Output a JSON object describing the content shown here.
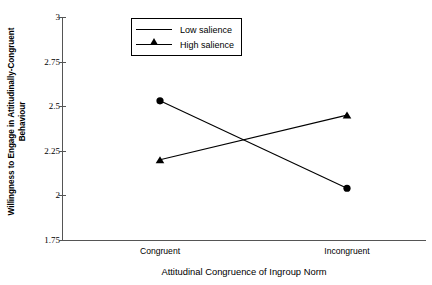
{
  "chart_data": {
    "type": "line",
    "title": "",
    "xlabel": "Attitudinal Congruence of Ingroup Norm",
    "ylabel_line1": "Willingness to Engage in Attitudinally-Congruent",
    "ylabel_line2": "Behaviour",
    "categories": [
      "Congruent",
      "Incongruent"
    ],
    "series": [
      {
        "name": "Low salience",
        "marker": "triangle",
        "values": [
          2.2,
          2.45
        ]
      },
      {
        "name": "High salience",
        "marker": "circle",
        "values": [
          2.53,
          2.04
        ]
      }
    ],
    "ylim": [
      1.75,
      3
    ],
    "yticks": [
      "3",
      "2.75",
      "2.5",
      "2.25",
      "2",
      "1.75"
    ],
    "ytick_values": [
      3,
      2.75,
      2.5,
      2.25,
      2,
      1.75
    ],
    "grid": false,
    "legend_position": "upper-center-left",
    "line_color": "#000000",
    "axis_color": "#555555",
    "background": "#ffffff"
  },
  "legend": {
    "entries": [
      {
        "label": "Low salience"
      },
      {
        "label": "High salience"
      }
    ]
  }
}
